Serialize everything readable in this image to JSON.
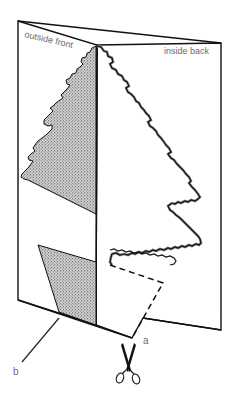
{
  "figure": {
    "type": "instructional-diagram",
    "labels": {
      "outside_front": "outside front",
      "inside_back": "inside back",
      "a": "a",
      "b": "b"
    },
    "colors": {
      "line": "#111111",
      "label": "#6b6b6b",
      "stipple_fill": "#8a8a8a",
      "background": "#ffffff"
    },
    "elements": [
      {
        "id": "card-front",
        "description": "outside front panel of folded card"
      },
      {
        "id": "card-back",
        "description": "inside back panel of folded card"
      },
      {
        "id": "fold-line",
        "description": "vertical fold of the card"
      },
      {
        "id": "stippled-tree-half",
        "description": "half tree shape shaded on outside front"
      },
      {
        "id": "tree-outline-cut",
        "description": "zig-zag tree outline on inside back"
      },
      {
        "id": "stippled-trunk",
        "description": "shaded trunk region marked b"
      },
      {
        "id": "dashed-cut-line",
        "description": "dashed cutting guide marked a"
      },
      {
        "id": "scissors",
        "description": "scissors icon indicating cut"
      }
    ]
  }
}
